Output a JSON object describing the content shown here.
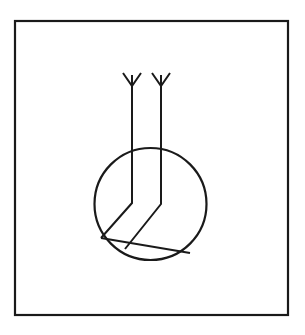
{
  "document": {
    "title": "Technical line drawing",
    "kind": "patent-style figure",
    "background_color": "#ffffff",
    "ink_color": "#1a1a1a"
  },
  "canvas": {
    "width": 305,
    "height": 335
  },
  "frame": {
    "name": "outer-border",
    "x": 15,
    "y": 21,
    "width": 273,
    "height": 294,
    "stroke_width": 2.2,
    "color": "#1a1a1a"
  },
  "circle": {
    "name": "circle-outline",
    "center_x": 150.5,
    "center_y": 204,
    "radius": 56,
    "stroke_width": 2.2,
    "color": "#1a1a1a"
  },
  "strands": [
    {
      "name": "left-strand",
      "top_x": 132,
      "top_y": 75,
      "bend_x": 132,
      "bend_y": 203,
      "end_x": 101,
      "end_y": 238,
      "stroke_width": 2.0
    },
    {
      "name": "right-strand",
      "top_x": 161,
      "top_y": 75,
      "bend_x": 161,
      "bend_y": 204,
      "end_x": 125,
      "end_y": 249,
      "stroke_width": 2.0
    }
  ],
  "fletchings": [
    {
      "name": "left-fletching",
      "apex_x": 132,
      "apex_y": 86,
      "left_tip_x": 123,
      "left_tip_y": 73,
      "right_tip_x": 141,
      "right_tip_y": 73,
      "stroke_width": 2.0
    },
    {
      "name": "right-fletching",
      "apex_x": 161,
      "apex_y": 86,
      "left_tip_x": 152,
      "left_tip_y": 73,
      "right_tip_x": 170,
      "right_tip_y": 73,
      "stroke_width": 2.0
    }
  ],
  "chord": {
    "name": "lower-chord",
    "x1": 101,
    "y1": 238,
    "x2": 190,
    "y2": 253,
    "stroke_width": 2.0
  }
}
